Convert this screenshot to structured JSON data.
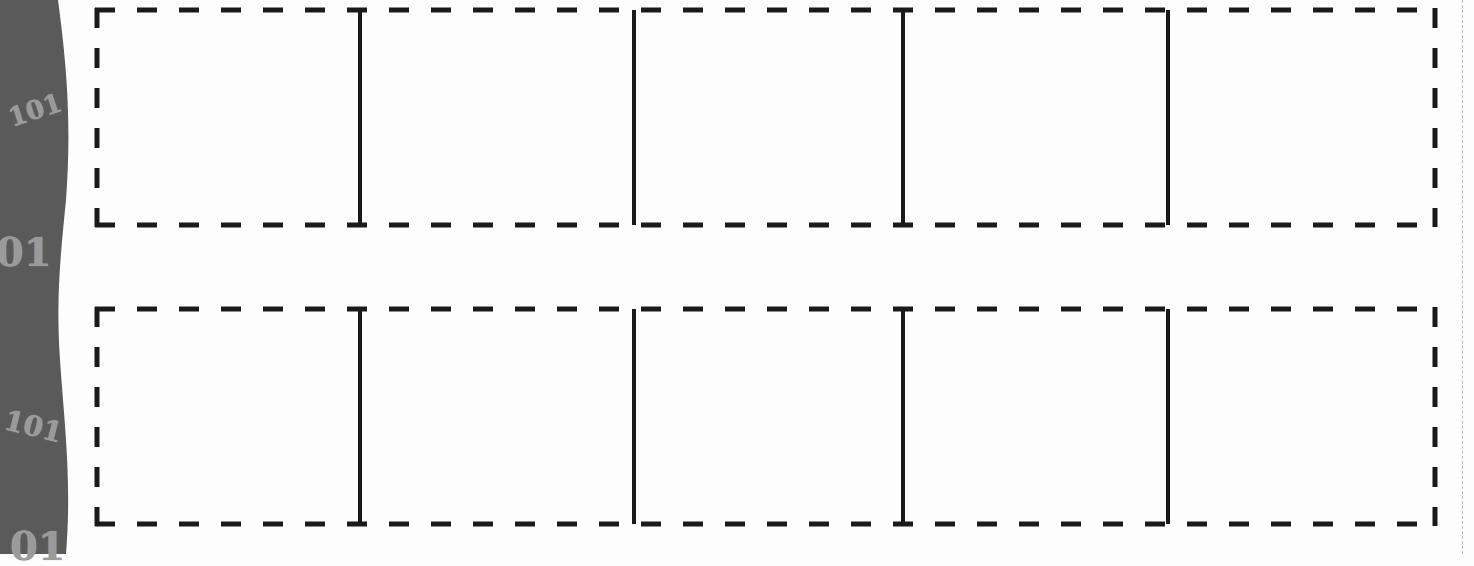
{
  "colors": {
    "strip": "#5a5a5a",
    "strip_text": "#9a9a9a",
    "line": "#1a1a1a",
    "cut_line": "#bdbdbd",
    "paper": "#fdfdfd"
  },
  "side_strip": {
    "decorations": [
      "101",
      "01",
      "101",
      "01"
    ]
  },
  "worksheet": {
    "rows": [
      {
        "cells": [
          "",
          "",
          "",
          "",
          ""
        ]
      },
      {
        "cells": [
          "",
          "",
          "",
          "",
          ""
        ]
      }
    ],
    "dividers_x": [
      360,
      634,
      903,
      1168
    ]
  }
}
